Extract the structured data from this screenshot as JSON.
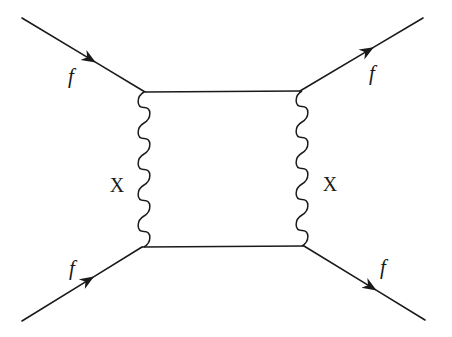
{
  "diagram": {
    "type": "feynman-box-diagram",
    "stroke_color": "#1a1a1a",
    "background": "#ffffff",
    "vertices": {
      "top_left": [
        145,
        92
      ],
      "top_right": [
        300,
        91
      ],
      "bottom_left": [
        142,
        247
      ],
      "bottom_right": [
        304,
        246
      ]
    },
    "fermion_lines": [
      {
        "id": "in-top",
        "from": [
          22,
          18
        ],
        "to": [
          145,
          92
        ],
        "label": "f",
        "label_pos": [
          71,
          76
        ]
      },
      {
        "id": "out-top",
        "from": [
          300,
          91
        ],
        "to": [
          423,
          18
        ],
        "label": "f",
        "label_pos": [
          372,
          73
        ]
      },
      {
        "id": "in-bottom",
        "from": [
          22,
          321
        ],
        "to": [
          142,
          247
        ],
        "label": "f",
        "label_pos": [
          72,
          268
        ]
      },
      {
        "id": "out-bottom",
        "from": [
          304,
          246
        ],
        "to": [
          425,
          320
        ],
        "label": "f",
        "label_pos": [
          383,
          267
        ]
      }
    ],
    "internal_lines": [
      {
        "id": "top-rung",
        "from": [
          145,
          92
        ],
        "to": [
          300,
          91
        ]
      },
      {
        "id": "bottom-rung",
        "from": [
          142,
          247
        ],
        "to": [
          304,
          246
        ]
      }
    ],
    "boson_lines": [
      {
        "id": "left-boson",
        "x": 144,
        "y1": 92,
        "y2": 247,
        "label": "X",
        "label_pos": [
          117,
          185
        ]
      },
      {
        "id": "right-boson",
        "x": 302,
        "y1": 91,
        "y2": 246,
        "label": "X",
        "label_pos": [
          330,
          184
        ]
      }
    ]
  },
  "labels": {
    "f_in_top": "f",
    "f_out_top": "f",
    "f_in_bottom": "f",
    "f_out_bottom": "f",
    "x_left": "X",
    "x_right": "X"
  }
}
